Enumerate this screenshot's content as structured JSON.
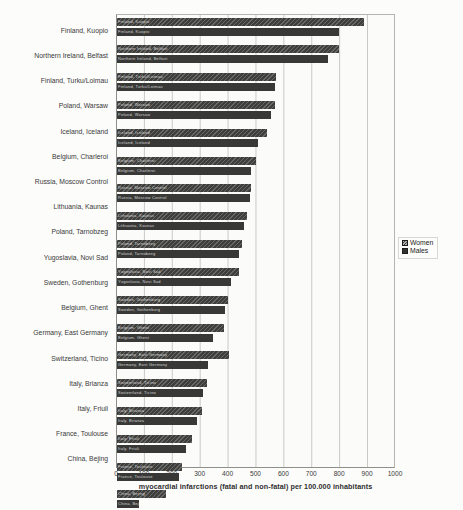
{
  "figure": {
    "kind": "scanned grouped horizontal bar chart",
    "background_color": "#fcfcfb",
    "bar_color": "#3a3a38",
    "gridline_color": "#c9c9c4"
  },
  "chart_data": {
    "type": "bar",
    "orientation": "horizontal",
    "title": "",
    "xlabel": "myocardial infarctions (fatal and non-fatal) per 100.000 inhabitants",
    "ylabel": "",
    "xlim": [
      0,
      1000
    ],
    "xticks": [
      0,
      100,
      200,
      300,
      400,
      500,
      600,
      700,
      800,
      900,
      1000
    ],
    "grid": "vertical gridlines every 100",
    "legend": {
      "position": "right",
      "entries": [
        {
          "label": "Women",
          "style": "dark hatched square"
        },
        {
          "label": "Males",
          "style": "dark solid square"
        }
      ]
    },
    "categories": [
      "Finland, Kuopio",
      "Northern Ireland, Belfast",
      "Finland, Turku/Loimau",
      "Poland, Warsaw",
      "Iceland, Iceland",
      "Belgium, Charleroi",
      "Russia, Moscow Control",
      "Lithuania, Kaunas",
      "Poland, Tarnobzeg",
      "Yugoslavia, Novi Sad",
      "Sweden, Gothenburg",
      "Belgium, Ghent",
      "Germany, East Germany",
      "Switzerland, Ticino",
      "Italy, Brianza",
      "Italy, Friuli",
      "France, Toulouse",
      "China, Bejing"
    ],
    "series": [
      {
        "name": "Women",
        "values": [
          890,
          800,
          575,
          570,
          540,
          500,
          485,
          470,
          450,
          440,
          400,
          385,
          405,
          325,
          305,
          270,
          235,
          175
        ]
      },
      {
        "name": "Males",
        "values": [
          800,
          760,
          570,
          555,
          510,
          485,
          480,
          460,
          440,
          410,
          390,
          345,
          330,
          310,
          290,
          250,
          225,
          80
        ]
      }
    ],
    "bar_inner_text_note": "each bar carries tiny illegible light text at its left end (category name)"
  }
}
